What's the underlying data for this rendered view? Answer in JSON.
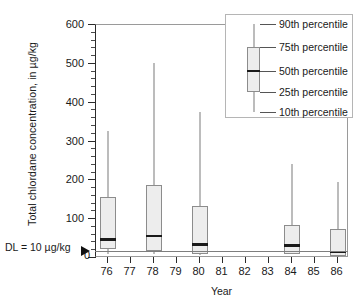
{
  "chart_data": {
    "type": "box",
    "title": "",
    "xlabel": "Year",
    "ylabel": "Total chlordane concentration, in µg/kg",
    "ylim": [
      0,
      600
    ],
    "ytick_major": [
      0,
      100,
      200,
      300,
      400,
      500,
      600
    ],
    "ytick_minor_step": 20,
    "grid": false,
    "categories": [
      "76",
      "77",
      "78",
      "79",
      "80",
      "81",
      "82",
      "83",
      "84",
      "85",
      "86"
    ],
    "annotation": {
      "detection_limit_label": "DL = 10 µg/kg",
      "detection_limit_value": 10,
      "zero_label": "0"
    },
    "boxes": [
      {
        "category": "76",
        "p10": 10,
        "p25": 22,
        "p50": 48,
        "p75": 158,
        "p90": 328
      },
      {
        "category": "78",
        "p10": 10,
        "p25": 18,
        "p50": 57,
        "p75": 188,
        "p90": 502
      },
      {
        "category": "80",
        "p10": 8,
        "p25": 10,
        "p50": 35,
        "p75": 133,
        "p90": 375
      },
      {
        "category": "84",
        "p10": 10,
        "p25": 10,
        "p50": 32,
        "p75": 85,
        "p90": 243
      },
      {
        "category": "86",
        "p10": 5,
        "p25": 6,
        "p50": 15,
        "p75": 75,
        "p90": 196
      }
    ],
    "legend": {
      "position": "top-right",
      "entries": [
        {
          "label": "90th percentile",
          "percentile": 90
        },
        {
          "label": "75th percentile",
          "percentile": 75
        },
        {
          "label": "50th percentile",
          "percentile": 50
        },
        {
          "label": "25th percentile",
          "percentile": 25
        },
        {
          "label": "10th percentile",
          "percentile": 10
        }
      ],
      "sample_box": {
        "p10": 380,
        "p25": 420,
        "p50": 463,
        "p75": 512,
        "p90": 558
      }
    },
    "colors": {
      "box_fill": "#ededed",
      "box_border": "#8c8c8c",
      "median": "#1a1a1a",
      "whisker": "#7a7a7a",
      "axis": "#2b2b2b",
      "frame": "#9a9a9a",
      "background": "#ffffff"
    }
  }
}
